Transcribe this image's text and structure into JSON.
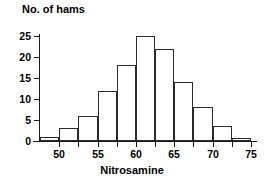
{
  "chart_data": {
    "type": "bar",
    "title": "",
    "xlabel": "Nitrosamine",
    "ylabel": "No. of hams",
    "xlim": [
      47.5,
      75
    ],
    "ylim": [
      0,
      25
    ],
    "grid": false,
    "legend": null,
    "bin_width": 2.5,
    "bin_edges": [
      47.5,
      50,
      52.5,
      55,
      57.5,
      60,
      62.5,
      65,
      67.5,
      70,
      72.5,
      75
    ],
    "categories": [
      "47.5-50",
      "50-52.5",
      "52.5-55",
      "55-57.5",
      "57.5-60",
      "60-62.5",
      "62.5-65",
      "65-67.5",
      "67.5-70",
      "70-72.5",
      "72.5-75"
    ],
    "values": [
      1,
      3,
      6,
      12,
      18,
      25,
      22,
      14,
      8,
      3.5,
      0.7
    ],
    "xticks": [
      50,
      55,
      60,
      65,
      70,
      75
    ],
    "xticklabels": [
      "50",
      "55",
      "60",
      "65",
      "70",
      "75"
    ],
    "xminorticks": [
      50,
      52.5,
      55,
      57.5,
      60,
      62.5,
      65,
      67.5,
      70,
      72.5,
      75
    ],
    "yticks": [
      0,
      5,
      10,
      15,
      20,
      25
    ],
    "yticklabels": [
      "0",
      "5",
      "10",
      "15",
      "20",
      "25"
    ],
    "colors": {
      "bar_fill": "#ffffff",
      "bar_edge": "#2b2b2b",
      "axis": "#1a1a1a",
      "text": "#000000",
      "background": "#ffffff"
    }
  }
}
